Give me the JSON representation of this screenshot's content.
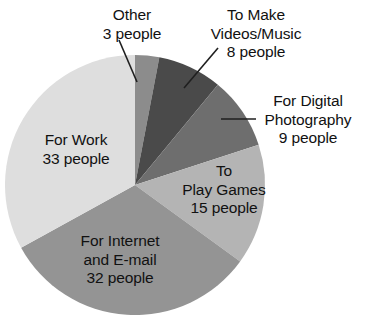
{
  "chart_data": {
    "type": "pie",
    "title": "",
    "subtitle": "",
    "xlabel": "",
    "ylabel": "",
    "unit": "people",
    "total": 100,
    "legend_position": "none",
    "grid": false,
    "start_angle_deg": 0,
    "direction": "clockwise",
    "categories": [
      "Other",
      "To Make Videos/Music",
      "For Digital Photography",
      "To Play Games",
      "For Internet and E-mail",
      "For Work"
    ],
    "values": [
      3,
      8,
      9,
      15,
      32,
      33
    ],
    "colors": [
      "#8c8c8c",
      "#4a4a4a",
      "#6e6e6e",
      "#b4b4b4",
      "#949494",
      "#dedede"
    ],
    "slices": [
      {
        "name": "Other",
        "value": 3,
        "unit_label": "3 people",
        "color": "#8c8c8c",
        "label_placement": "outside",
        "label_lines": [
          "Other",
          "3 people"
        ]
      },
      {
        "name": "To Make Videos/Music",
        "value": 8,
        "unit_label": "8 people",
        "color": "#4a4a4a",
        "label_placement": "outside",
        "label_lines": [
          "To Make",
          "Videos/Music",
          "8 people"
        ]
      },
      {
        "name": "For Digital Photography",
        "value": 9,
        "unit_label": "9 people",
        "color": "#6e6e6e",
        "label_placement": "outside",
        "label_lines": [
          "For Digital",
          "Photography",
          "9 people"
        ]
      },
      {
        "name": "To Play Games",
        "value": 15,
        "unit_label": "15 people",
        "color": "#b4b4b4",
        "label_placement": "inside",
        "label_lines": [
          "To",
          "Play Games",
          "15 people"
        ]
      },
      {
        "name": "For Internet and E-mail",
        "value": 32,
        "unit_label": "32 people",
        "color": "#949494",
        "label_placement": "inside",
        "label_lines": [
          "For Internet",
          "and E-mail",
          "32 people"
        ]
      },
      {
        "name": "For Work",
        "value": 33,
        "unit_label": "33 people",
        "color": "#dedede",
        "label_placement": "inside",
        "label_lines": [
          "For Work",
          "33 people"
        ]
      }
    ]
  },
  "labels": {
    "other": {
      "line1": "Other",
      "line2": "3 people"
    },
    "videos": {
      "line1": "To Make",
      "line2": "Videos/Music",
      "line3": "8 people"
    },
    "photography": {
      "line1": "For Digital",
      "line2": "Photography",
      "line3": "9 people"
    },
    "games": {
      "line1": "To",
      "line2": "Play Games",
      "line3": "15 people"
    },
    "internet": {
      "line1": "For Internet",
      "line2": "and E-mail",
      "line3": "32 people"
    },
    "work": {
      "line1": "For Work",
      "line2": "33 people"
    }
  },
  "colors": {
    "background": "#ffffff",
    "text": "#111111",
    "leader_line": "#1f1f1f",
    "slice_other": "#8c8c8c",
    "slice_videos": "#4a4a4a",
    "slice_photography": "#6e6e6e",
    "slice_games": "#b4b4b4",
    "slice_internet": "#949494",
    "slice_work": "#dedede"
  }
}
